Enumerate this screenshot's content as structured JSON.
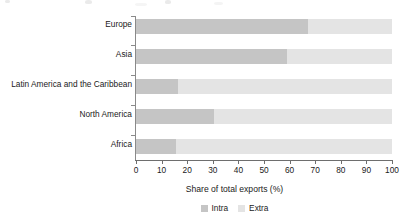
{
  "chart_data": {
    "type": "bar",
    "orientation": "horizontal",
    "stacked": true,
    "title": "",
    "xlabel": "Share of total exports (%)",
    "ylabel": "",
    "xlim": [
      0,
      100
    ],
    "xticks": [
      0,
      10,
      20,
      30,
      40,
      50,
      60,
      70,
      80,
      90,
      100
    ],
    "xtick_labels": [
      "0",
      "10",
      "20",
      "30",
      "40",
      "50",
      "60",
      "70",
      "80",
      "90",
      "100"
    ],
    "grid": false,
    "legend_position": "bottom-center",
    "categories": [
      "Europe",
      "Asia",
      "Latin America and the Caribbean",
      "North America",
      "Africa"
    ],
    "series": [
      {
        "name": "Intra",
        "color": "#c5c5c5",
        "values": [
          67.0,
          59.0,
          16.5,
          30.5,
          15.5
        ]
      },
      {
        "name": "Extra",
        "color": "#e4e4e4",
        "values": [
          33.0,
          41.0,
          83.5,
          69.5,
          84.5
        ]
      }
    ]
  },
  "legend": {
    "items": [
      {
        "label": "Intra",
        "color": "#c5c5c5"
      },
      {
        "label": "Extra",
        "color": "#e4e4e4"
      }
    ]
  },
  "axis": {
    "x_title": "Share of total exports (%)"
  }
}
